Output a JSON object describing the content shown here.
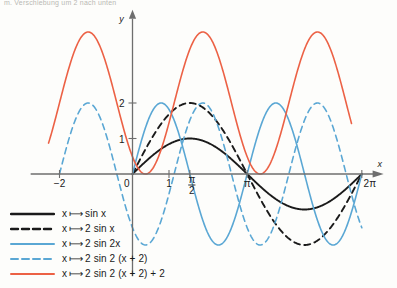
{
  "figure": {
    "top_note": "m. Verschiebung um 2 nach unten",
    "axis": {
      "y_label": "y",
      "x_label": "x",
      "x_ticks": [
        {
          "value": -2,
          "label": "−2"
        },
        {
          "value": 0,
          "label": "0"
        },
        {
          "value": 1,
          "label": "1"
        },
        {
          "value": 1.5708,
          "label": "π/2"
        },
        {
          "value": 3.1416,
          "label": "π"
        },
        {
          "value": 6.2832,
          "label": "2π"
        }
      ],
      "y_ticks": [
        {
          "value": 1,
          "label": "1"
        },
        {
          "value": 2,
          "label": "2"
        }
      ],
      "xlim": [
        -2.9,
        7.1
      ],
      "ylim": [
        -2.6,
        4.6
      ]
    },
    "legend": [
      {
        "label_prefix": "x",
        "mapsto": "⟼",
        "expression": "sin x",
        "color": "#1a1a1a",
        "style": "solid"
      },
      {
        "label_prefix": "x",
        "mapsto": "⟼",
        "expression": "2 sin x",
        "color": "#1a1a1a",
        "style": "dashed"
      },
      {
        "label_prefix": "x",
        "mapsto": "⟼",
        "expression": "2 sin 2x",
        "color": "#5aa7d4",
        "style": "solid"
      },
      {
        "label_prefix": "x",
        "mapsto": "⟼",
        "expression": "2 sin 2 (x + 2)",
        "color": "#5aa7d4",
        "style": "dashed"
      },
      {
        "label_prefix": "x",
        "mapsto": "⟼",
        "expression": "2 sin 2 (x + 2) + 2",
        "color": "#ec6145",
        "style": "solid"
      }
    ]
  },
  "chart_data": {
    "type": "line",
    "title": "",
    "xlabel": "x",
    "ylabel": "y",
    "xlim": [
      -2.9,
      7.1
    ],
    "ylim": [
      -2.6,
      4.6
    ],
    "grid": false,
    "legend_position": "below-left",
    "x_ticks": [
      -2,
      0,
      1,
      1.5708,
      3.1416,
      6.2832
    ],
    "x_tick_labels": [
      "−2",
      "0",
      "1",
      "π/2",
      "π",
      "2π"
    ],
    "y_ticks": [
      1,
      2
    ],
    "y_tick_labels": [
      "1",
      "2"
    ],
    "series": [
      {
        "name": "x ⟼ sin x",
        "formula": "sin(x)",
        "amplitude": 1,
        "frequency": 1,
        "phase": 0,
        "offset": 0,
        "color": "#1a1a1a",
        "style": "solid",
        "domain": [
          0,
          6.2832
        ],
        "key_points": [
          {
            "x": 0,
            "y": 0
          },
          {
            "x": 1.5708,
            "y": 1
          },
          {
            "x": 3.1416,
            "y": 0
          },
          {
            "x": 4.7124,
            "y": -1
          },
          {
            "x": 6.2832,
            "y": 0
          }
        ]
      },
      {
        "name": "x ⟼ 2 sin x",
        "formula": "2*sin(x)",
        "amplitude": 2,
        "frequency": 1,
        "phase": 0,
        "offset": 0,
        "color": "#1a1a1a",
        "style": "dashed",
        "domain": [
          0,
          6.2832
        ],
        "key_points": [
          {
            "x": 0,
            "y": 0
          },
          {
            "x": 1.5708,
            "y": 2
          },
          {
            "x": 3.1416,
            "y": 0
          },
          {
            "x": 4.7124,
            "y": -2
          },
          {
            "x": 6.2832,
            "y": 0
          }
        ]
      },
      {
        "name": "x ⟼ 2 sin 2x",
        "formula": "2*sin(2x)",
        "amplitude": 2,
        "frequency": 2,
        "phase": 0,
        "offset": 0,
        "color": "#5aa7d4",
        "style": "solid",
        "domain": [
          0,
          6.2832
        ],
        "key_points": [
          {
            "x": 0,
            "y": 0
          },
          {
            "x": 0.7854,
            "y": 2
          },
          {
            "x": 1.5708,
            "y": 0
          },
          {
            "x": 2.3562,
            "y": -2
          },
          {
            "x": 3.1416,
            "y": 0
          },
          {
            "x": 3.927,
            "y": 2
          },
          {
            "x": 4.7124,
            "y": 0
          },
          {
            "x": 5.4978,
            "y": -2
          },
          {
            "x": 6.2832,
            "y": 0
          }
        ]
      },
      {
        "name": "x ⟼ 2 sin 2 (x + 2)",
        "formula": "2*sin(2*(x+2))",
        "amplitude": 2,
        "frequency": 2,
        "phase": 2,
        "offset": 0,
        "color": "#5aa7d4",
        "style": "dashed",
        "domain": [
          -2,
          6.2832
        ],
        "key_points": [
          {
            "x": -2,
            "y": 0
          },
          {
            "x": -1.2146,
            "y": 2
          },
          {
            "x": -0.4292,
            "y": 0
          },
          {
            "x": 0.3562,
            "y": -2
          },
          {
            "x": 1.1416,
            "y": 0
          },
          {
            "x": 1.927,
            "y": 2
          },
          {
            "x": 2.7124,
            "y": 0
          },
          {
            "x": 3.4978,
            "y": -2
          },
          {
            "x": 4.2832,
            "y": 0
          }
        ]
      },
      {
        "name": "x ⟼ 2 sin 2 (x + 2) + 2",
        "formula": "2*sin(2*(x+2)) + 2",
        "amplitude": 2,
        "frequency": 2,
        "phase": 2,
        "offset": 2,
        "color": "#ec6145",
        "style": "solid",
        "domain": [
          -2.3,
          6.0
        ],
        "key_points": [
          {
            "x": -2,
            "y": 2
          },
          {
            "x": -1.2146,
            "y": 4
          },
          {
            "x": -0.4292,
            "y": 2
          },
          {
            "x": 0.3562,
            "y": 0
          },
          {
            "x": 1.1416,
            "y": 2
          },
          {
            "x": 1.927,
            "y": 4
          },
          {
            "x": 2.7124,
            "y": 2
          },
          {
            "x": 3.4978,
            "y": 0
          },
          {
            "x": 4.2832,
            "y": 2
          }
        ]
      }
    ]
  }
}
